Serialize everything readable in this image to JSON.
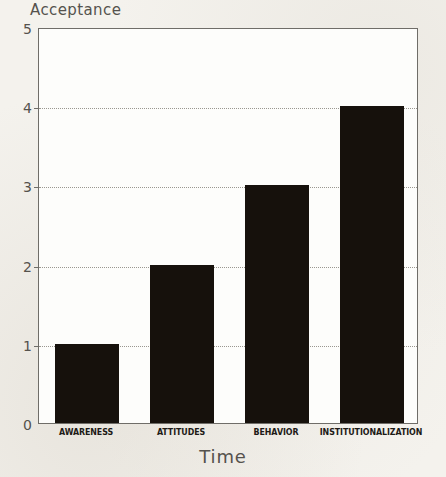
{
  "chart_data": {
    "type": "bar",
    "title": "",
    "ylabel": "Acceptance",
    "xlabel": "Time",
    "categories": [
      "AWARENESS",
      "ATTITUDES",
      "BEHAVIOR",
      "INSTITUTIONALIZATION"
    ],
    "values": [
      1,
      2,
      3,
      4
    ],
    "ylim": [
      0,
      5
    ],
    "ytick_labels": [
      "0",
      "1",
      "2",
      "3",
      "4",
      "5"
    ],
    "ytick_values": [
      0,
      1,
      2,
      3,
      4,
      5
    ],
    "grid": "horizontal dotted at 1,2,3,4",
    "legend": "none",
    "bar_color": "#16110c",
    "plot_background": "#fdfdfb",
    "page_background": "#f4f2ed",
    "axis_color": "#6f6d68",
    "gridline_color": "#9a9790"
  }
}
